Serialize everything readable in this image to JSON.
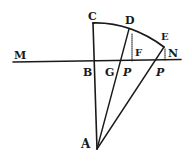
{
  "diagram": {
    "type": "geometric-figure",
    "ink_color": "#1a1a1a",
    "background": "#ffffff",
    "points": [
      {
        "id": "C",
        "label": "C"
      },
      {
        "id": "D",
        "label": "D"
      },
      {
        "id": "E",
        "label": "E"
      },
      {
        "id": "F",
        "label": "F"
      },
      {
        "id": "M",
        "label": "M"
      },
      {
        "id": "N",
        "label": "N"
      },
      {
        "id": "B",
        "label": "B"
      },
      {
        "id": "G",
        "label": "G"
      },
      {
        "id": "P1",
        "label": "P"
      },
      {
        "id": "P2",
        "label": "P"
      },
      {
        "id": "A",
        "label": "A"
      }
    ],
    "segments": [
      {
        "from": "M",
        "to": "N",
        "style": "solid"
      },
      {
        "from": "C",
        "to": "A",
        "style": "solid"
      },
      {
        "from": "A",
        "to": "D",
        "style": "solid"
      },
      {
        "from": "A",
        "to": "E",
        "style": "solid"
      },
      {
        "from": "D",
        "to": "F",
        "style": "dotted"
      },
      {
        "from": "E",
        "to": "N",
        "style": "dotted"
      }
    ],
    "arcs": [
      {
        "through": [
          "C",
          "D",
          "E"
        ],
        "style": "solid"
      }
    ]
  }
}
